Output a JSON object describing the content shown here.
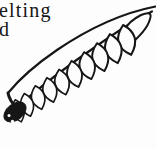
{
  "page": {
    "background": "#fdfdfd",
    "ink": "#161616"
  },
  "caption": {
    "line1": "elting",
    "line2": "d"
  }
}
